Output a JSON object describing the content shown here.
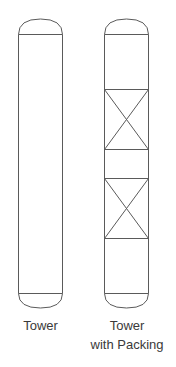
{
  "diagram": {
    "stroke_color": "#5a5a5a",
    "towers": [
      {
        "id": "tower",
        "label_lines": [
          "Tower"
        ],
        "packing_sections": 0
      },
      {
        "id": "tower-with-packing",
        "label_lines": [
          "Tower",
          "with Packing"
        ],
        "packing_sections": 2
      }
    ]
  }
}
